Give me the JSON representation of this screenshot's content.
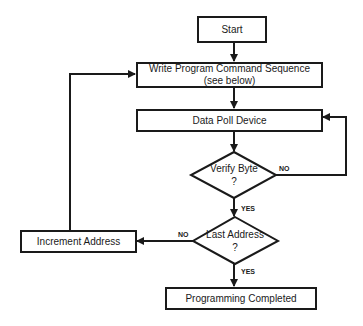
{
  "flowchart": {
    "nodes": {
      "start": {
        "label": "Start",
        "shape": "rectangle"
      },
      "write": {
        "line1": "Write Program Command Sequence",
        "line2": "(see below)",
        "shape": "rectangle"
      },
      "poll": {
        "label": "Data Poll Device",
        "shape": "rectangle"
      },
      "verify": {
        "line1": "Verify Byte",
        "line2": "?",
        "shape": "diamond"
      },
      "last": {
        "line1": "Last Address",
        "line2": "?",
        "shape": "diamond"
      },
      "increment": {
        "label": "Increment Address",
        "shape": "rectangle"
      },
      "done": {
        "label": "Programming Completed",
        "shape": "rectangle"
      }
    },
    "edge_labels": {
      "verify_no": "NO",
      "verify_yes": "YES",
      "last_no": "NO",
      "last_yes": "YES"
    },
    "edges": [
      {
        "from": "start",
        "to": "write"
      },
      {
        "from": "write",
        "to": "poll"
      },
      {
        "from": "poll",
        "to": "verify"
      },
      {
        "from": "verify",
        "to": "poll",
        "label": "NO"
      },
      {
        "from": "verify",
        "to": "last",
        "label": "YES"
      },
      {
        "from": "last",
        "to": "increment",
        "label": "NO"
      },
      {
        "from": "last",
        "to": "done",
        "label": "YES"
      },
      {
        "from": "increment",
        "to": "write"
      }
    ]
  }
}
